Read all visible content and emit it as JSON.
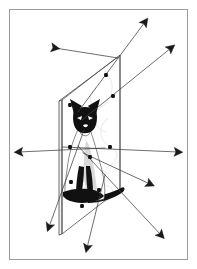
{
  "figure": {
    "title": "Siamese cat with projection plane and ray vectors",
    "background_color": "#ffffff",
    "line_color": "#3d3d3d",
    "arrow_color": "#1a1a1a",
    "plane_color": "#4a4a4a",
    "dot_color": "#111111",
    "frame": {
      "stroke_color": "#9b9b9b",
      "x": 9,
      "y": 9,
      "width": 179,
      "height": 251
    }
  },
  "plane": {
    "label": "projection-plane",
    "fill": "none",
    "stroke": "#4a4a4a",
    "corners": [
      {
        "name": "top-left",
        "x": 62,
        "y": 100
      },
      {
        "name": "top-right",
        "x": 120,
        "y": 55
      },
      {
        "name": "bottom-right",
        "x": 120,
        "y": 189
      },
      {
        "name": "bottom-left",
        "x": 62,
        "y": 234
      }
    ],
    "thickness_px": 3
  },
  "cat": {
    "label": "siamese-cat",
    "pose": "seated, facing viewer",
    "dark_points": [
      "face-mask",
      "ears",
      "forelegs",
      "hind-paws",
      "tail"
    ],
    "body_fill": "#ffffff",
    "mask_fill": "#111111"
  },
  "rays": [
    {
      "id": "ray-1",
      "name": "ray-upper-left",
      "x1": 118,
      "y1": 58,
      "x2": 55,
      "y2": 48,
      "arrow_at": "end",
      "angle_deg": 189,
      "direction": "up-left"
    },
    {
      "id": "ray-2",
      "name": "ray-upper-right-steep",
      "x1": 78,
      "y1": 112,
      "x2": 145,
      "y2": 22,
      "arrow_at": "end",
      "angle_deg": 306,
      "direction": "up-right"
    },
    {
      "id": "ray-3",
      "name": "ray-upper-right-shallow",
      "x1": 82,
      "y1": 120,
      "x2": 171,
      "y2": 48,
      "arrow_at": "end",
      "angle_deg": 321,
      "direction": "up-right"
    },
    {
      "id": "ray-4",
      "name": "ray-left-horizontal",
      "x1": 105,
      "y1": 148,
      "x2": 19,
      "y2": 152,
      "arrow_at": "end",
      "angle_deg": 177,
      "direction": "left"
    },
    {
      "id": "ray-5",
      "name": "ray-right-horizontal",
      "x1": 62,
      "y1": 147,
      "x2": 178,
      "y2": 152,
      "arrow_at": "end",
      "angle_deg": 2,
      "direction": "right"
    },
    {
      "id": "ray-6",
      "name": "ray-lower-right-mid",
      "x1": 83,
      "y1": 153,
      "x2": 150,
      "y2": 184,
      "arrow_at": "end",
      "angle_deg": 25,
      "direction": "down-right"
    },
    {
      "id": "ray-7",
      "name": "ray-lower-right-far",
      "x1": 78,
      "y1": 146,
      "x2": 161,
      "y2": 235,
      "arrow_at": "end",
      "angle_deg": 47,
      "direction": "down-right"
    },
    {
      "id": "ray-8",
      "name": "ray-lower-left",
      "x1": 84,
      "y1": 130,
      "x2": 49,
      "y2": 227,
      "arrow_at": "end",
      "angle_deg": 110,
      "direction": "down-left"
    },
    {
      "id": "ray-9",
      "name": "ray-down-center",
      "x1": 105,
      "y1": 175,
      "x2": 87,
      "y2": 248,
      "arrow_at": "end",
      "angle_deg": 104,
      "direction": "down"
    }
  ],
  "intersection_points": [
    {
      "id": "pt-1",
      "name": "point-plane-top-left",
      "x": 70,
      "y": 105
    },
    {
      "id": "pt-2",
      "name": "point-upper-mid",
      "x": 106,
      "y": 75
    },
    {
      "id": "pt-3",
      "name": "point-upper-right",
      "x": 113,
      "y": 96
    },
    {
      "id": "pt-4",
      "name": "point-left-mid",
      "x": 70,
      "y": 147
    },
    {
      "id": "pt-5",
      "name": "point-right-mid",
      "x": 110,
      "y": 147
    },
    {
      "id": "pt-6",
      "name": "point-chest",
      "x": 90,
      "y": 157
    },
    {
      "id": "pt-7",
      "name": "point-lower-right",
      "x": 99,
      "y": 190
    },
    {
      "id": "pt-8",
      "name": "point-lower-left-body",
      "x": 71,
      "y": 182
    },
    {
      "id": "pt-9",
      "name": "point-bottom-center",
      "x": 82,
      "y": 206
    }
  ],
  "arrowheads": [
    {
      "id": "ah-1",
      "name": "arrowhead-upper-left",
      "x": 55,
      "y": 48,
      "angle_deg": 9
    },
    {
      "id": "ah-2",
      "name": "arrowhead-top",
      "x": 145,
      "y": 22,
      "angle_deg": 306
    },
    {
      "id": "ah-3",
      "name": "arrowhead-upper-right",
      "x": 171,
      "y": 48,
      "angle_deg": 321
    },
    {
      "id": "ah-4",
      "name": "arrowhead-left",
      "x": 19,
      "y": 152,
      "angle_deg": 177
    },
    {
      "id": "ah-5",
      "name": "arrowhead-right",
      "x": 178,
      "y": 152,
      "angle_deg": 2
    },
    {
      "id": "ah-6",
      "name": "arrowhead-mid-right-lower",
      "x": 150,
      "y": 184,
      "angle_deg": 25
    },
    {
      "id": "ah-7",
      "name": "arrowhead-bottom-right",
      "x": 161,
      "y": 235,
      "angle_deg": 47
    },
    {
      "id": "ah-8",
      "name": "arrowhead-bottom-left",
      "x": 49,
      "y": 227,
      "angle_deg": 110
    },
    {
      "id": "ah-9",
      "name": "arrowhead-bottom-center",
      "x": 87,
      "y": 248,
      "angle_deg": 104
    }
  ]
}
